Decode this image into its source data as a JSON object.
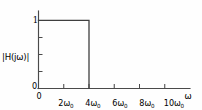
{
  "figure": {
    "ylabel": "|H(jω)|",
    "xlabel": "ω",
    "origin_label_y": "0",
    "origin_label_x": "0",
    "ytick_one": "1",
    "background_color": "#fefefe",
    "line_color": "#3f3f3f",
    "axis_color": "#4a4a4a"
  },
  "chart_data": {
    "type": "line",
    "title": "",
    "xlabel": "ω",
    "ylabel": "|H(jω)|",
    "x": [
      0,
      4,
      4,
      12
    ],
    "y": [
      1,
      1,
      0,
      0
    ],
    "xlim": [
      0,
      12
    ],
    "ylim": [
      0,
      1.18
    ],
    "grid": false,
    "legend": null,
    "x_unit": "ω₀",
    "xticks": [
      0,
      2,
      4,
      6,
      8,
      10
    ],
    "xticklabels": [
      "0",
      "2ω₀",
      "4ω₀",
      "6ω₀",
      "8ω₀",
      "10ω₀"
    ],
    "xtick_parts": [
      {
        "main": "0",
        "sub": ""
      },
      {
        "main": "2ω",
        "sub": "0"
      },
      {
        "main": "4ω",
        "sub": "0"
      },
      {
        "main": "6ω",
        "sub": "0"
      },
      {
        "main": "8ω",
        "sub": "0"
      },
      {
        "main": "10ω",
        "sub": "0"
      }
    ],
    "yticks": [
      0,
      1
    ],
    "yticklabels": [
      "0",
      "1"
    ],
    "cutoff": 4,
    "passband_value": 1,
    "stopband_value": 0
  }
}
